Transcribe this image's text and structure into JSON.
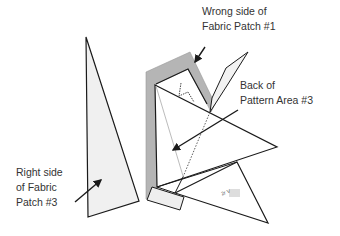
{
  "diagram": {
    "type": "quilting paper-piecing illustration",
    "labels": {
      "wrong_side": [
        "Wrong side of",
        "Fabric Patch #1"
      ],
      "back_of_pattern": [
        "Back of",
        "Pattern Area #3"
      ],
      "right_side": [
        "Right side",
        "of Fabric",
        "Patch #3"
      ]
    },
    "small_mark_text": "2r V",
    "colors": {
      "stroke": "#1a1a1a",
      "fabric_gray": "#b5b5b5",
      "light_fill": "#f0f0f0",
      "text": "#333333"
    }
  }
}
